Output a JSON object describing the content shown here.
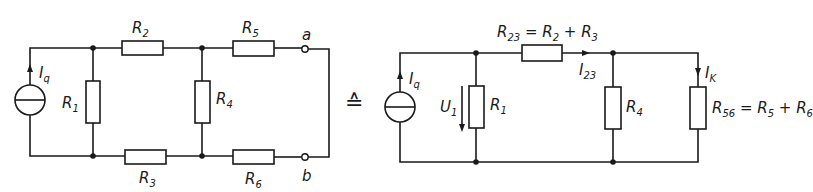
{
  "left_circuit": {
    "source_label": "I",
    "source_sub": "q",
    "resistors": [
      {
        "id": "R1",
        "label": "R",
        "sub": "1"
      },
      {
        "id": "R2",
        "label": "R",
        "sub": "2"
      },
      {
        "id": "R3",
        "label": "R",
        "sub": "3"
      },
      {
        "id": "R4",
        "label": "R",
        "sub": "4"
      },
      {
        "id": "R5",
        "label": "R",
        "sub": "5"
      },
      {
        "id": "R6",
        "label": "R",
        "sub": "6"
      }
    ],
    "terminals": {
      "a": "a",
      "b": "b"
    }
  },
  "equivalence_symbol": "≙",
  "right_circuit": {
    "source_label": "I",
    "source_sub": "q",
    "voltage_label": "U",
    "voltage_sub": "1",
    "r1": {
      "label": "R",
      "sub": "1"
    },
    "r23": {
      "label": "R",
      "sub": "23",
      "eq": " = R",
      "sub2": "2",
      "plus": " + R",
      "sub3": "3"
    },
    "i23": {
      "label": "I",
      "sub": "23"
    },
    "r4": {
      "label": "R",
      "sub": "4"
    },
    "ik": {
      "label": "I",
      "sub": "K"
    },
    "r56": {
      "label": "R",
      "sub": "56",
      "eq": " = R",
      "sub2": "5",
      "plus": " + R",
      "sub3": "6"
    }
  }
}
